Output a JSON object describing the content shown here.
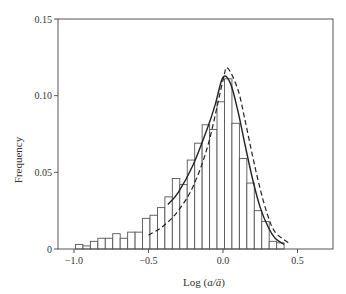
{
  "chart_data": {
    "type": "bar",
    "title": "",
    "xlabel": "Log (a/ā)",
    "xlabel_parts": {
      "prefix": "Log (",
      "italic": "a/ā",
      "suffix": ")"
    },
    "ylabel": "Frequency",
    "xlim": [
      -1.1,
      0.73
    ],
    "ylim": [
      0,
      0.15
    ],
    "xticks": [
      -1.0,
      -0.5,
      0.0,
      0.5
    ],
    "xtick_labels": [
      "−1.0",
      "−0.5",
      "0.0",
      "0.5"
    ],
    "yticks": [
      0,
      0.05,
      0.1,
      0.15
    ],
    "ytick_labels": [
      "0",
      "0.05",
      "0.10",
      "0.15"
    ],
    "grid": false,
    "legend": null,
    "histogram": {
      "bin_width": 0.05,
      "bin_start": -0.99,
      "values": [
        0.003,
        0.002,
        0.005,
        0.007,
        0.007,
        0.01,
        0.007,
        0.011,
        0.011,
        0.02,
        0.022,
        0.027,
        0.034,
        0.046,
        0.042,
        0.058,
        0.069,
        0.081,
        0.078,
        0.096,
        0.111,
        0.082,
        0.059,
        0.043,
        0.025,
        0.018,
        0.005,
        0.004
      ]
    },
    "series": [
      {
        "name": "fit-solid",
        "style": "solid",
        "x": [
          -0.37,
          -0.3,
          -0.2,
          -0.1,
          -0.05,
          0.0,
          0.05,
          0.1,
          0.15,
          0.2,
          0.25,
          0.3,
          0.35,
          0.41
        ],
        "y": [
          0.029,
          0.037,
          0.055,
          0.08,
          0.095,
          0.112,
          0.108,
          0.09,
          0.067,
          0.045,
          0.027,
          0.015,
          0.007,
          0.003
        ]
      },
      {
        "name": "fit-dashed",
        "style": "dashed",
        "x": [
          -0.5,
          -0.4,
          -0.3,
          -0.2,
          -0.1,
          0.0,
          0.03,
          0.1,
          0.15,
          0.2,
          0.25,
          0.3,
          0.35,
          0.44
        ],
        "y": [
          0.009,
          0.015,
          0.025,
          0.041,
          0.068,
          0.11,
          0.118,
          0.104,
          0.083,
          0.06,
          0.039,
          0.022,
          0.011,
          0.004
        ]
      }
    ]
  }
}
